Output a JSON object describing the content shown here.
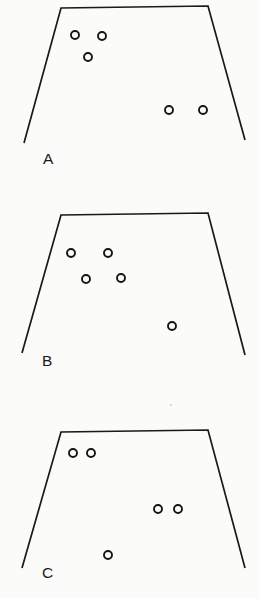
{
  "figure": {
    "background_color": "#fbfbfa",
    "line_color": "#191919",
    "marker_stroke_color": "#151515",
    "width": 260,
    "height": 599
  },
  "panels": [
    {
      "id": "panel-a",
      "label": "A",
      "label_position": {
        "x": 43,
        "y": 164
      },
      "outline": {
        "shape": "open-trapezoid",
        "points": "24,143 61,8 208,6 245,140"
      },
      "marker_count": 5,
      "markers": [
        {
          "id": "a-1",
          "cx": 75,
          "cy": 35,
          "r": 4.0
        },
        {
          "id": "a-2",
          "cx": 102,
          "cy": 36,
          "r": 4.0
        },
        {
          "id": "a-3",
          "cx": 88,
          "cy": 57,
          "r": 4.0
        },
        {
          "id": "a-4",
          "cx": 169,
          "cy": 110,
          "r": 4.0
        },
        {
          "id": "a-5",
          "cx": 203,
          "cy": 110,
          "r": 4.0
        }
      ]
    },
    {
      "id": "panel-b",
      "label": "B",
      "label_position": {
        "x": 42,
        "y": 366
      },
      "outline": {
        "shape": "open-trapezoid",
        "points": "22,353 61,215 208,213 245,355"
      },
      "marker_count": 5,
      "markers": [
        {
          "id": "b-1",
          "cx": 71,
          "cy": 253,
          "r": 4.0
        },
        {
          "id": "b-2",
          "cx": 108,
          "cy": 253,
          "r": 4.0
        },
        {
          "id": "b-3",
          "cx": 86,
          "cy": 279,
          "r": 4.0
        },
        {
          "id": "b-4",
          "cx": 121,
          "cy": 278,
          "r": 4.0
        },
        {
          "id": "b-5",
          "cx": 172,
          "cy": 326,
          "r": 4.0
        }
      ]
    },
    {
      "id": "panel-c",
      "label": "C",
      "label_position": {
        "x": 42,
        "y": 578
      },
      "outline": {
        "shape": "open-trapezoid",
        "points": "22,568 61,432 208,430 245,568"
      },
      "marker_count": 5,
      "markers": [
        {
          "id": "c-1",
          "cx": 73,
          "cy": 453,
          "r": 4.0
        },
        {
          "id": "c-2",
          "cx": 91,
          "cy": 453,
          "r": 4.0
        },
        {
          "id": "c-3",
          "cx": 158,
          "cy": 509,
          "r": 4.0
        },
        {
          "id": "c-4",
          "cx": 178,
          "cy": 509,
          "r": 4.0
        },
        {
          "id": "c-5",
          "cx": 108,
          "cy": 555,
          "r": 4.0
        }
      ]
    }
  ],
  "artifacts": [
    {
      "id": "scan-speck-1",
      "cx": 171,
      "cy": 405,
      "r": 0.9
    }
  ]
}
